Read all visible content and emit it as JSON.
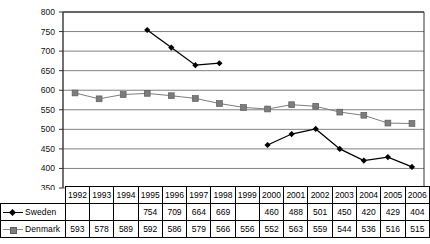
{
  "chart_data": {
    "type": "line",
    "title": "",
    "xlabel": "",
    "ylabel": "",
    "ylim": [
      350,
      800
    ],
    "ytick_step": 50,
    "yticks": [
      800,
      750,
      700,
      650,
      600,
      550,
      500,
      450,
      400,
      350
    ],
    "grid": true,
    "legend_position": "table-left",
    "categories": [
      "1992",
      "1993",
      "1994",
      "1995",
      "1996",
      "1997",
      "1998",
      "1999",
      "2000",
      "2001",
      "2002",
      "2003",
      "2004",
      "2005",
      "2006"
    ],
    "series": [
      {
        "name": "Sweden",
        "marker": "diamond",
        "color": "#000000",
        "values": [
          null,
          null,
          null,
          754,
          709,
          664,
          669,
          null,
          460,
          488,
          501,
          450,
          420,
          429,
          404
        ],
        "labels": [
          "",
          "",
          "",
          "754",
          "709",
          "664",
          "669",
          "",
          "460",
          "488",
          "501",
          "450",
          "420",
          "429",
          "404"
        ]
      },
      {
        "name": "Denmark",
        "marker": "square",
        "color": "#7d7d7d",
        "values": [
          593,
          578,
          589,
          592,
          586,
          579,
          566,
          556,
          552,
          563,
          559,
          544,
          536,
          516,
          515
        ],
        "labels": [
          "593",
          "578",
          "589",
          "592",
          "586",
          "579",
          "566",
          "556",
          "552",
          "563",
          "559",
          "544",
          "536",
          "516",
          "515"
        ]
      }
    ]
  },
  "table": {
    "corner_label": "",
    "header": [
      "1992",
      "1993",
      "1994",
      "1995",
      "1996",
      "1997",
      "1998",
      "1999",
      "2000",
      "2001",
      "2002",
      "2003",
      "2004",
      "2005",
      "2006"
    ],
    "rows": [
      {
        "label": "Sweden",
        "marker": "diamond-marker-icon",
        "values": [
          "",
          "",
          "",
          "754",
          "709",
          "664",
          "669",
          "",
          "460",
          "488",
          "501",
          "450",
          "420",
          "429",
          "404"
        ]
      },
      {
        "label": "Denmark",
        "marker": "square-marker-icon",
        "values": [
          "593",
          "578",
          "589",
          "592",
          "586",
          "579",
          "566",
          "556",
          "552",
          "563",
          "559",
          "544",
          "536",
          "516",
          "515"
        ]
      }
    ]
  },
  "colors": {
    "sweden": "#000000",
    "denmark": "#7d7d7d",
    "gridline": "#808080",
    "axis": "#333333",
    "background": "#ffffff"
  }
}
